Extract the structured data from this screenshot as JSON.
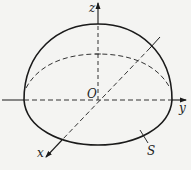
{
  "diagram": {
    "type": "3d-surface-sketch",
    "colors": {
      "ink": "#1a1a1a",
      "dashed": "#333333",
      "background": "#f4f4f2"
    },
    "axes": {
      "z": {
        "label": "z"
      },
      "y": {
        "label": "y"
      },
      "x": {
        "label": "x"
      }
    },
    "origin": {
      "label": "O"
    },
    "surface": {
      "label": "S"
    }
  }
}
